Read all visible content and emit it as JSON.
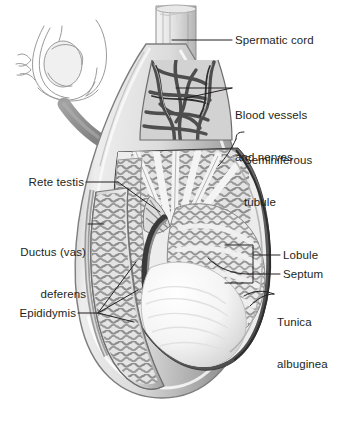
{
  "figure": {
    "background_color": "#ffffff",
    "ink_color": "#231f20",
    "tone_mid": "#9a9a9a",
    "tone_dark": "#5d5d5d",
    "tone_light": "#d5d5d5"
  },
  "inset": {
    "name": "scrotum-outline-inset",
    "description": "line-art orientation sketch of testis within scrotum"
  },
  "arrow": {
    "name": "magnify-arrow",
    "description": "curved gray arrow from inset to main figure",
    "color": "#8c8c8c"
  },
  "labels": {
    "spermatic_cord": {
      "text": "Spermatic cord",
      "lines": [
        "Spermatic cord"
      ],
      "side": "right",
      "x": 235,
      "y": 34
    },
    "blood_vessels": {
      "text": "Blood vessels and nerves",
      "lines": [
        "Blood vessels",
        "and nerves"
      ],
      "side": "right",
      "x": 235,
      "y": 80
    },
    "seminiferous_tubule": {
      "text": "Seminiferous tubule",
      "lines": [
        "Seminiferous",
        "tubule"
      ],
      "side": "right",
      "x": 240,
      "y": 132
    },
    "lobule": {
      "text": "Lobule",
      "lines": [
        "Lobule"
      ],
      "side": "right",
      "x": 282,
      "y": 249
    },
    "septum": {
      "text": "Septum",
      "lines": [
        "Septum"
      ],
      "side": "right",
      "x": 282,
      "y": 268
    },
    "tunica_albuginea": {
      "text": "Tunica albuginea",
      "lines": [
        "Tunica",
        "albuginea"
      ],
      "side": "right",
      "x": 277,
      "y": 288
    },
    "rete_testis": {
      "text": "Rete testis",
      "lines": [
        "Rete testis"
      ],
      "side": "left",
      "x": 22,
      "y": 175
    },
    "ductus_deferens": {
      "text": "Ductus (vas) deferens",
      "lines": [
        "Ductus (vas)",
        "deferens"
      ],
      "side": "left",
      "x": 10,
      "y": 218
    },
    "epididymis": {
      "text": "Epididymis",
      "lines": [
        "Epididymis"
      ],
      "side": "left",
      "x": 18,
      "y": 305
    }
  }
}
